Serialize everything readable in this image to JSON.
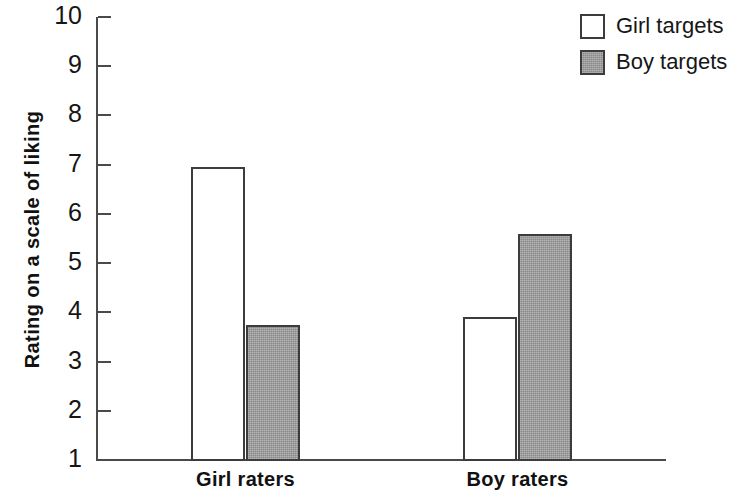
{
  "chart_data": {
    "type": "bar",
    "title": "",
    "xlabel": "",
    "ylabel": "Rating on a scale of liking",
    "categories": [
      "Girl raters",
      "Boy raters"
    ],
    "series": [
      {
        "name": "Girl targets",
        "values": [
          6.95,
          3.9
        ],
        "color": "#ffffff"
      },
      {
        "name": "Boy targets",
        "values": [
          3.75,
          5.6
        ],
        "color": "#9a9a9a"
      }
    ],
    "ylim": [
      1,
      10
    ],
    "yticks": [
      10,
      9,
      8,
      7,
      6,
      5,
      4,
      3,
      2,
      1
    ],
    "ytick_labels": [
      "10",
      "9",
      "8",
      "7",
      "6",
      "5",
      "4",
      "3",
      "2",
      "1"
    ],
    "grid": false,
    "legend_position": "top-right",
    "bar_outline_color": "#3c3c3c",
    "axis_color": "#4a4a4a"
  },
  "legend": {
    "entries": [
      {
        "label": "Girl targets",
        "swatch": "white-swatch"
      },
      {
        "label": "Boy targets",
        "swatch": "gray-swatch"
      }
    ]
  },
  "axes": {
    "y_title": "Rating on a scale of liking",
    "x_group_labels": [
      "Girl raters",
      "Boy raters"
    ]
  }
}
